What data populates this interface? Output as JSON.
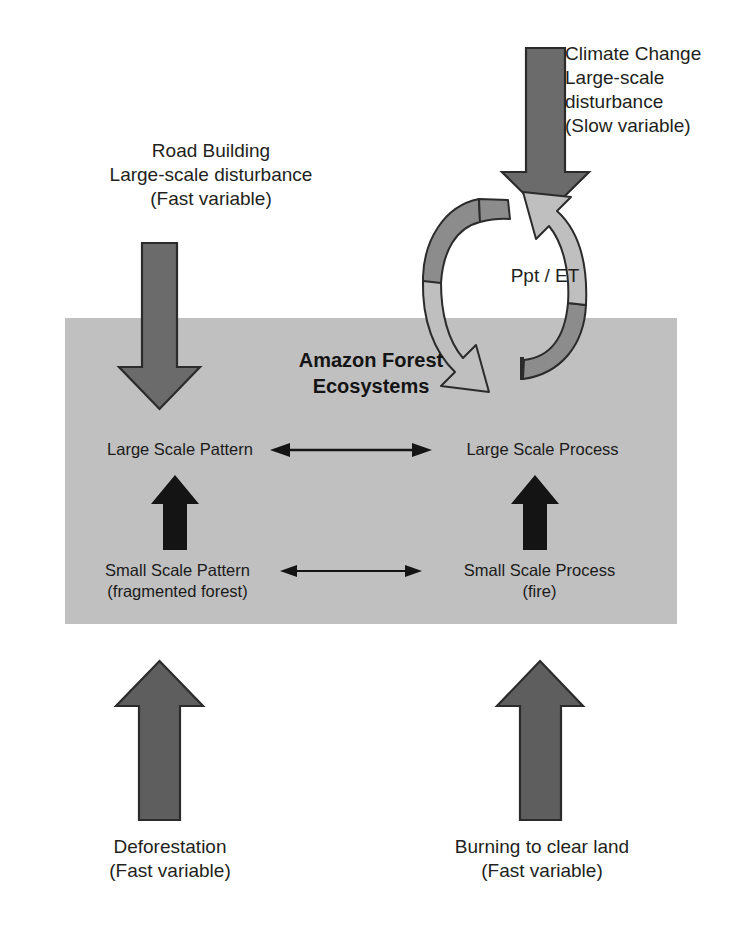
{
  "diagram": {
    "title": "Amazon Forest Ecosystems",
    "box": {
      "heading": "Amazon Forest\nEcosystems",
      "fill_color": "#c0c0c0"
    },
    "nodes": [
      {
        "id": "large-scale-pattern",
        "label": "Large Scale Pattern"
      },
      {
        "id": "large-scale-process",
        "label": "Large Scale Process"
      },
      {
        "id": "small-scale-pattern",
        "label": "Small Scale Pattern\n(fragmented forest)"
      },
      {
        "id": "small-scale-process",
        "label": "Small Scale Process\n(fire)"
      }
    ],
    "external_drivers": [
      {
        "id": "climate-change",
        "label": "Climate Change\nLarge-scale\ndisturbance\n(Slow variable)",
        "arrow": "down",
        "color": "#6b6b6b"
      },
      {
        "id": "road-building",
        "label": "Road Building\nLarge-scale disturbance\n(Fast variable)",
        "arrow": "down",
        "color": "#6b6b6b"
      },
      {
        "id": "deforestation",
        "label": "Deforestation\n(Fast variable)",
        "arrow": "up",
        "color": "#5e5e5e"
      },
      {
        "id": "burning-to-clear-land",
        "label": "Burning to clear land\n(Fast variable)",
        "arrow": "up",
        "color": "#5e5e5e"
      }
    ],
    "cycle": {
      "label": "Ppt / ET",
      "arrow_dark_color": "#8c8c8c",
      "arrow_light_color": "#bfbfbf"
    },
    "connectors": [
      {
        "id": "large-scale-link",
        "kind": "double-headed-horizontal"
      },
      {
        "id": "small-scale-link",
        "kind": "double-headed-horizontal"
      },
      {
        "id": "pattern-up-link",
        "kind": "single-headed-up"
      },
      {
        "id": "process-up-link",
        "kind": "single-headed-up"
      }
    ],
    "colors": {
      "box_gray": "#c0c0c0",
      "arrow_gray": "#6b6b6b",
      "arrow_black": "#141414",
      "text": "#231f20",
      "background": "#ffffff"
    }
  }
}
